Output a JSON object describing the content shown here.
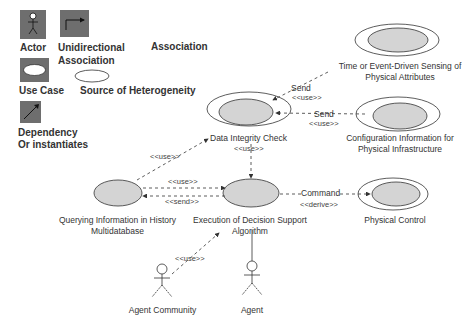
{
  "legend": {
    "actor": "Actor",
    "unidirectional_line1": "Unidirectional",
    "unidirectional_line2": "Association",
    "association": "Association",
    "use_case": "Use Case",
    "source_heterogeneity": "Source of Heterogeneity",
    "dependency_line1": "Dependency",
    "dependency_line2": "Or instantiates"
  },
  "nodes": {
    "time_sensing_line1": "Time or Event-Driven Sensing of",
    "time_sensing_line2": "Physical Attributes",
    "data_integrity": "Data Integrity Check",
    "config_line1": "Configuration Information for",
    "config_line2": "Physical Infrastructure",
    "querying_line1": "Querying Information in History",
    "querying_line2": "Multidatabase",
    "execution_line1": "Execution of Decision Support",
    "execution_line2": "Algorithm",
    "physical_control": "Physical Control",
    "agent_community": "Agent Community",
    "agent": "Agent"
  },
  "edges": {
    "send1": "Send",
    "use1": "<<use>>",
    "send2": "Send",
    "use2": "<<use>>",
    "use_dic_exec": "<<use>>",
    "use_query_dic": "<<use>>",
    "use_query_exec": "<<use>>",
    "send_exec_query": "<<send>>",
    "command": "Command",
    "derive": "<<derive>>",
    "use_agentcomm": "<<use>>"
  },
  "colors": {
    "legend_box": "#6e6e6e",
    "usecase_fill": "#d4d4d4",
    "line": "#333333"
  }
}
